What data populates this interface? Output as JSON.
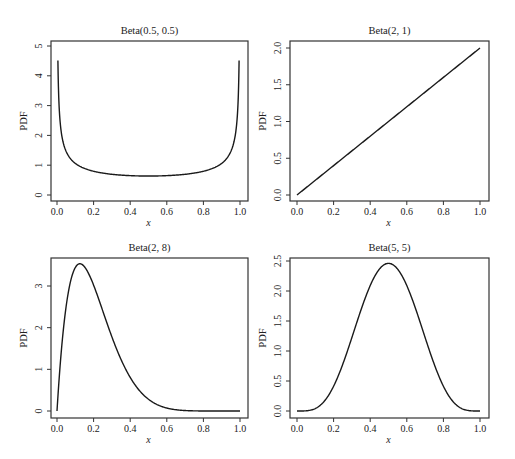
{
  "figure": {
    "width": 515,
    "height": 459,
    "line_color": "#1a1a1a",
    "frame_color": "#333333"
  },
  "chart_data": [
    {
      "type": "line",
      "title": "Beta(0.5, 0.5)",
      "xlabel": "x",
      "ylabel": "PDF",
      "alpha": 0.5,
      "beta": 0.5,
      "xlim": [
        0,
        1
      ],
      "ylim": [
        0,
        5
      ],
      "xticks": [
        "0.0",
        "0.2",
        "0.4",
        "0.6",
        "0.8",
        "1.0"
      ],
      "yticks": [
        "0",
        "1",
        "2",
        "3",
        "4",
        "5"
      ],
      "x": [
        0.005,
        0.02,
        0.05,
        0.1,
        0.2,
        0.3,
        0.4,
        0.5,
        0.6,
        0.7,
        0.8,
        0.9,
        0.95,
        0.98,
        0.995
      ],
      "y": [
        4.51,
        2.27,
        1.46,
        1.06,
        0.8,
        0.69,
        0.65,
        0.64,
        0.65,
        0.69,
        0.8,
        1.06,
        1.46,
        2.27,
        4.51
      ],
      "frame": {
        "left": 51,
        "top": 41,
        "right": 248,
        "bottom": 201
      },
      "px": {
        "x0": 57,
        "x1": 240,
        "y0": 195,
        "y1": 46,
        "yv1": 5
      }
    },
    {
      "type": "line",
      "title": "Beta(2, 1)",
      "xlabel": "x",
      "ylabel": "PDF",
      "alpha": 2,
      "beta": 1,
      "xlim": [
        0,
        1
      ],
      "ylim": [
        0,
        2
      ],
      "xticks": [
        "0.0",
        "0.2",
        "0.4",
        "0.6",
        "0.8",
        "1.0"
      ],
      "yticks": [
        "0.0",
        "0.5",
        "1.0",
        "1.5",
        "2.0"
      ],
      "x": [
        0,
        0.2,
        0.4,
        0.6,
        0.8,
        1.0
      ],
      "y": [
        0,
        0.4,
        0.8,
        1.2,
        1.6,
        2.0
      ],
      "frame": {
        "left": 290,
        "top": 41,
        "right": 489,
        "bottom": 201
      },
      "px": {
        "x0": 297,
        "x1": 480,
        "y0": 195,
        "y1": 48,
        "yv1": 2
      }
    },
    {
      "type": "line",
      "title": "Beta(2, 8)",
      "xlabel": "x",
      "ylabel": "PDF",
      "alpha": 2,
      "beta": 8,
      "xlim": [
        0,
        1
      ],
      "ylim": [
        0,
        3.5
      ],
      "xticks": [
        "0.0",
        "0.2",
        "0.4",
        "0.6",
        "0.8",
        "1.0"
      ],
      "yticks": [
        "0",
        "1",
        "2",
        "3"
      ],
      "x": [
        0,
        0.05,
        0.125,
        0.2,
        0.3,
        0.4,
        0.5,
        0.6,
        0.7,
        0.8,
        1.0
      ],
      "y": [
        0,
        2.39,
        3.52,
        3.02,
        1.78,
        0.81,
        0.28,
        0.07,
        0.01,
        0.0,
        0
      ],
      "frame": {
        "left": 51,
        "top": 258,
        "right": 248,
        "bottom": 418
      },
      "px": {
        "x0": 57,
        "x1": 240,
        "y0": 411,
        "y1": 286,
        "yv1": 3
      }
    },
    {
      "type": "line",
      "title": "Beta(5, 5)",
      "xlabel": "x",
      "ylabel": "PDF",
      "alpha": 5,
      "beta": 5,
      "xlim": [
        0,
        1
      ],
      "ylim": [
        0,
        2.5
      ],
      "xticks": [
        "0.0",
        "0.2",
        "0.4",
        "0.6",
        "0.8",
        "1.0"
      ],
      "yticks": [
        "0.0",
        "0.5",
        "1.0",
        "1.5",
        "2.0",
        "2.5"
      ],
      "x": [
        0,
        0.1,
        0.2,
        0.3,
        0.4,
        0.5,
        0.6,
        0.7,
        0.8,
        0.9,
        1.0
      ],
      "y": [
        0,
        0.04,
        0.42,
        1.33,
        2.15,
        2.46,
        2.15,
        1.33,
        0.42,
        0.04,
        0
      ],
      "frame": {
        "left": 290,
        "top": 258,
        "right": 489,
        "bottom": 418
      },
      "px": {
        "x0": 297,
        "x1": 480,
        "y0": 411,
        "y1": 261,
        "yv1": 2.5
      }
    }
  ]
}
